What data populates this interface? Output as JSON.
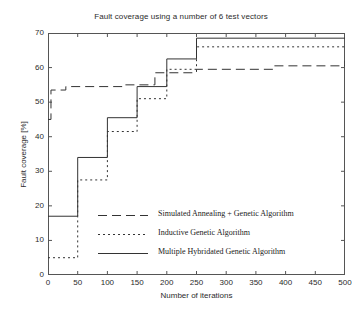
{
  "chart_data": {
    "type": "line",
    "title": "Fault coverage using a number of 6 test vectors",
    "xlabel": "Number of iterations",
    "ylabel": "Fault coverage [%]",
    "xlim": [
      0,
      500
    ],
    "ylim": [
      0,
      70
    ],
    "xticks": [
      0,
      50,
      100,
      150,
      200,
      250,
      300,
      350,
      400,
      450,
      500
    ],
    "yticks": [
      0,
      10,
      20,
      30,
      40,
      50,
      60,
      70
    ],
    "grid": false,
    "drawstyle": "steps-post",
    "legend_position": "lower center inside axes",
    "series": [
      {
        "name": "Simulated Annealing + Genetic Algorithm",
        "style": "dashed",
        "x": [
          0,
          5,
          30,
          130,
          180,
          250,
          380,
          500
        ],
        "y": [
          45,
          53.5,
          54.5,
          55,
          58.5,
          59.5,
          60.5,
          62
        ]
      },
      {
        "name": "Inductive Genetic Algorithm",
        "style": "dotted",
        "x": [
          0,
          50,
          100,
          150,
          200,
          250,
          500
        ],
        "y": [
          5,
          27.5,
          41.5,
          51,
          59.5,
          66,
          66
        ]
      },
      {
        "name": "Multiple Hybridated Genetic Algorithm",
        "style": "solid",
        "x": [
          0,
          50,
          100,
          150,
          200,
          250,
          500
        ],
        "y": [
          17,
          34,
          45.5,
          54.5,
          62.5,
          68.5,
          68.5
        ]
      }
    ]
  },
  "legend": {
    "entries": [
      {
        "label": "Simulated Annealing + Genetic Algorithm"
      },
      {
        "label": "Inductive Genetic Algorithm"
      },
      {
        "label": "Multiple Hybridated Genetic Algorithm"
      }
    ]
  },
  "colors": {
    "line": "#333333",
    "axis": "#555555",
    "text": "#2b2b2b",
    "background": "#ffffff"
  }
}
